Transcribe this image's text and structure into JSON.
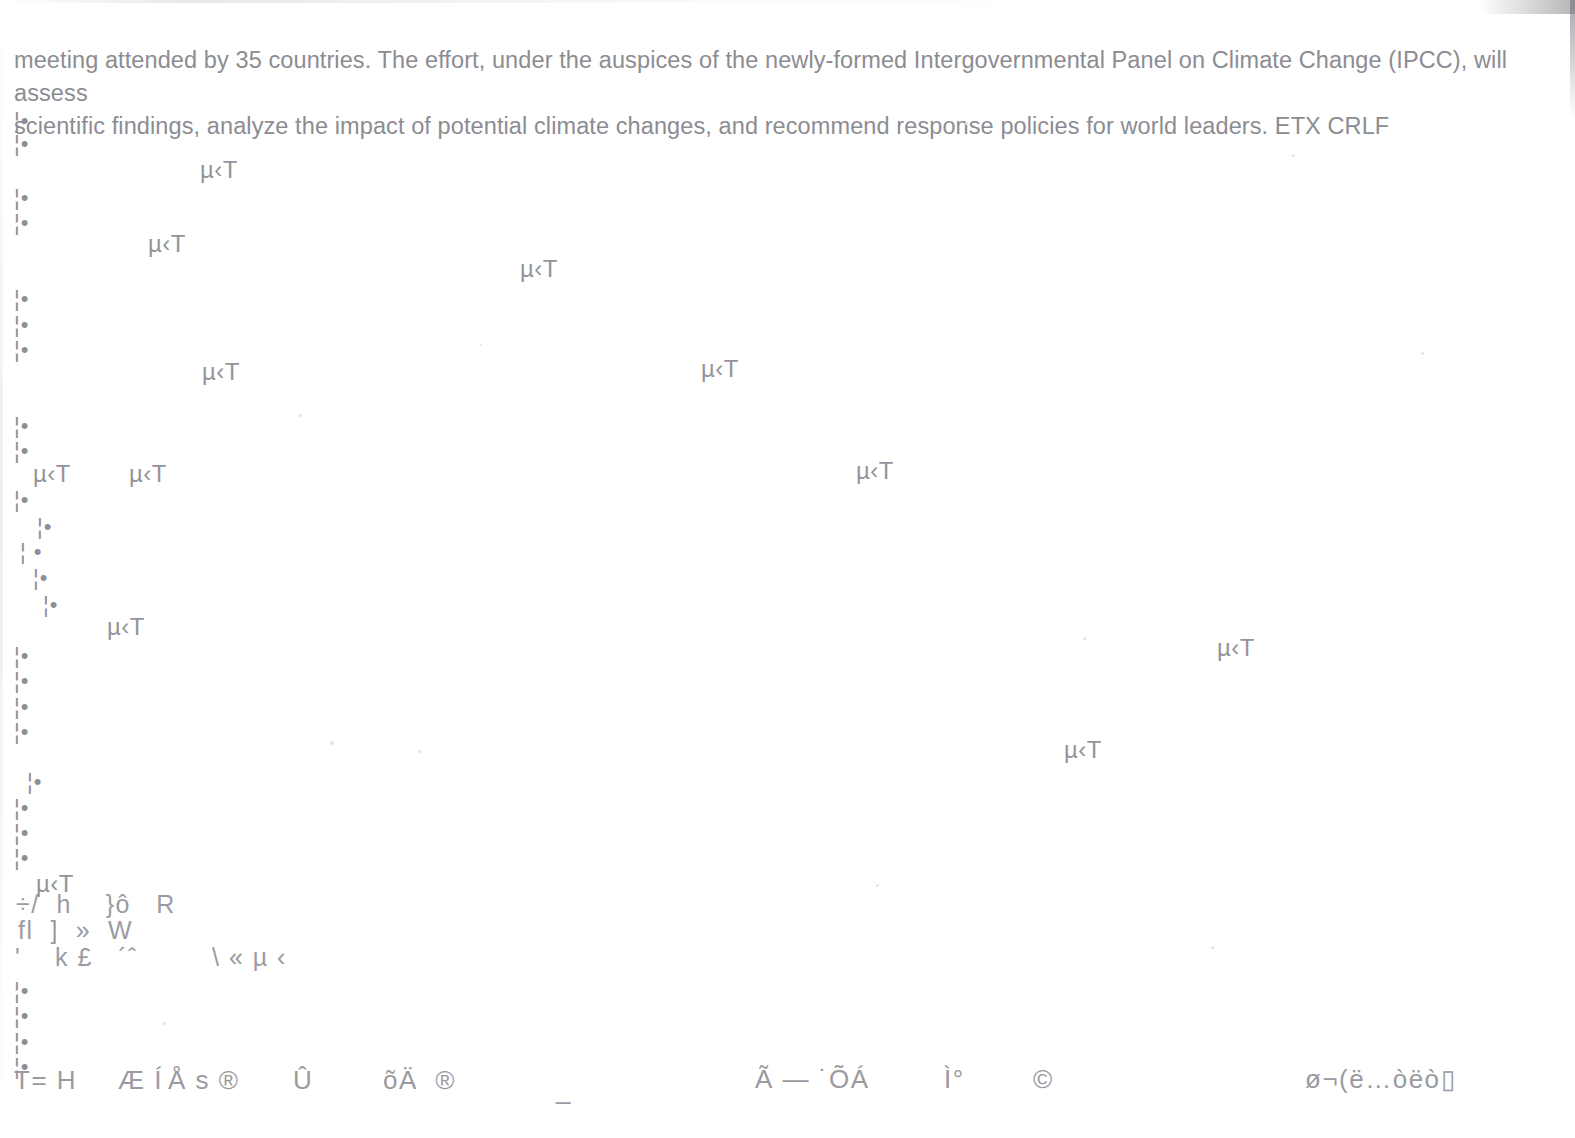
{
  "document": {
    "paragraph": "meeting attended by 35 countries. The effort, under the auspices of the newly-formed Intergovernmental Panel on Climate Change (IPCC), will assess\nscientific findings, analyze the impact of potential climate changes, and recommend response policies for world leaders. ETX CRLF",
    "text_color": "#8c8c92",
    "background_color": "#ffffff",
    "page_width": 1575,
    "page_height": 1138
  },
  "artifacts": {
    "margin_markers": [
      {
        "text": "¦•",
        "x": 14,
        "y": 110
      },
      {
        "text": "¦•",
        "x": 14,
        "y": 133
      },
      {
        "text": "¦•",
        "x": 14,
        "y": 187
      },
      {
        "text": "¦•",
        "x": 14,
        "y": 212
      },
      {
        "text": "¦•",
        "x": 14,
        "y": 288
      },
      {
        "text": "¦•",
        "x": 14,
        "y": 314
      },
      {
        "text": "¦•",
        "x": 14,
        "y": 339
      },
      {
        "text": "¦•",
        "x": 14,
        "y": 415
      },
      {
        "text": "¦•",
        "x": 14,
        "y": 440
      },
      {
        "text": "¦•",
        "x": 14,
        "y": 489
      },
      {
        "text": "¦•",
        "x": 37,
        "y": 516
      },
      {
        "text": "¦ •",
        "x": 20,
        "y": 541
      },
      {
        "text": "¦•",
        "x": 33,
        "y": 567
      },
      {
        "text": "¦•",
        "x": 43,
        "y": 594
      },
      {
        "text": "¦•",
        "x": 14,
        "y": 645
      },
      {
        "text": "¦•",
        "x": 14,
        "y": 670
      },
      {
        "text": "¦•",
        "x": 14,
        "y": 696
      },
      {
        "text": "¦•",
        "x": 14,
        "y": 721
      },
      {
        "text": "¦•",
        "x": 27,
        "y": 771
      },
      {
        "text": "¦•",
        "x": 14,
        "y": 797
      },
      {
        "text": "¦•",
        "x": 14,
        "y": 822
      },
      {
        "text": "¦•",
        "x": 14,
        "y": 847
      },
      {
        "text": "¦•",
        "x": 14,
        "y": 980
      },
      {
        "text": "¦•",
        "x": 14,
        "y": 1005
      },
      {
        "text": "¦•",
        "x": 14,
        "y": 1031
      },
      {
        "text": "¦•",
        "x": 14,
        "y": 1056
      }
    ],
    "mu_fragments": [
      {
        "text": "µ‹T",
        "x": 200,
        "y": 158
      },
      {
        "text": "µ‹T",
        "x": 148,
        "y": 232
      },
      {
        "text": "µ‹T",
        "x": 520,
        "y": 257
      },
      {
        "text": "µ‹T",
        "x": 202,
        "y": 360
      },
      {
        "text": "µ‹T",
        "x": 701,
        "y": 357
      },
      {
        "text": "µ‹T",
        "x": 33,
        "y": 462
      },
      {
        "text": "µ‹T",
        "x": 129,
        "y": 462
      },
      {
        "text": "µ‹T",
        "x": 856,
        "y": 459
      },
      {
        "text": "µ‹T",
        "x": 107,
        "y": 615
      },
      {
        "text": "µ‹T",
        "x": 1217,
        "y": 636
      },
      {
        "text": "µ‹T",
        "x": 1064,
        "y": 738
      },
      {
        "text": "µ‹T",
        "x": 36,
        "y": 872
      }
    ],
    "mixed_lines": [
      {
        "text": "÷/  h    }ô   R",
        "x": 16,
        "y": 892
      },
      {
        "text": "fl  ]  »  W",
        "x": 18,
        "y": 918
      },
      {
        "text": "'    k £   ´ˆ",
        "x": 15,
        "y": 945
      },
      {
        "text": "\\ « µ ‹",
        "x": 212,
        "y": 945
      }
    ],
    "footer_row": [
      {
        "text": "T= H",
        "x": 14,
        "y": 1067
      },
      {
        "text": "Æ Í",
        "x": 118,
        "y": 1067
      },
      {
        "text": "Å s ®",
        "x": 168,
        "y": 1067
      },
      {
        "text": "Û",
        "x": 293,
        "y": 1067
      },
      {
        "text": "õÄ  ®",
        "x": 383,
        "y": 1067
      },
      {
        "text": "_",
        "x": 556,
        "y": 1077
      },
      {
        "text": "Ã — ˙ÕÁ",
        "x": 755,
        "y": 1066
      },
      {
        "text": "Ì°",
        "x": 944,
        "y": 1066
      },
      {
        "text": "©",
        "x": 1033,
        "y": 1066
      },
      {
        "text": "ø¬(ë…òëò▯",
        "x": 1305,
        "y": 1066
      }
    ],
    "specks": [
      {
        "x": 965,
        "y": 122,
        "size": 3
      },
      {
        "x": 1292,
        "y": 154,
        "size": 3
      },
      {
        "x": 299,
        "y": 414,
        "size": 3
      },
      {
        "x": 480,
        "y": 344,
        "size": 2
      },
      {
        "x": 1421,
        "y": 352,
        "size": 3
      },
      {
        "x": 330,
        "y": 741,
        "size": 4
      },
      {
        "x": 418,
        "y": 750,
        "size": 3
      },
      {
        "x": 1083,
        "y": 637,
        "size": 3
      },
      {
        "x": 163,
        "y": 1022,
        "size": 3
      },
      {
        "x": 876,
        "y": 884,
        "size": 3
      },
      {
        "x": 1211,
        "y": 946,
        "size": 3
      }
    ]
  }
}
